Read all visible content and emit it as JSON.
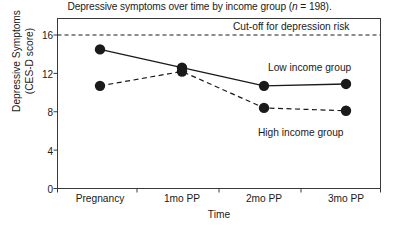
{
  "chart_data": {
    "type": "line",
    "title": "Depressive symptoms over time by income group (n = 198).",
    "title_parts": {
      "before": "Depressive symptoms over time by income group (",
      "italic": "n",
      "after": " = 198)."
    },
    "xlabel": "Time",
    "ylabel": "Depressive Symptoms",
    "ylabel_line2": "(CES-D score)",
    "categories": [
      "Pregnancy",
      "1mo PP",
      "2mo PP",
      "3mo PP"
    ],
    "yticks": [
      16,
      12,
      8,
      4,
      0
    ],
    "ylim": [
      0,
      17.5
    ],
    "grid": false,
    "legend_position": "inline-annotations",
    "series": [
      {
        "name": "Low income group",
        "values": [
          14.5,
          12.6,
          10.7,
          10.9
        ],
        "linestyle": "solid",
        "marker": "filled-circle",
        "color": "#1a1a1a"
      },
      {
        "name": "High income group",
        "values": [
          10.7,
          12.2,
          8.4,
          8.1
        ],
        "linestyle": "dashed",
        "marker": "filled-circle",
        "color": "#1a1a1a"
      }
    ],
    "annotations": [
      {
        "name": "cutoff-line",
        "label": "Cut-off for depression risk",
        "value": 16,
        "orientation": "horizontal",
        "linestyle": "dashed"
      },
      {
        "name": "low-income-label",
        "label": "Low income group"
      },
      {
        "name": "high-income-label",
        "label": "High income group"
      }
    ],
    "colors": {
      "axis": "#3a3a3a",
      "data": "#1a1a1a",
      "background": "#ffffff"
    }
  }
}
